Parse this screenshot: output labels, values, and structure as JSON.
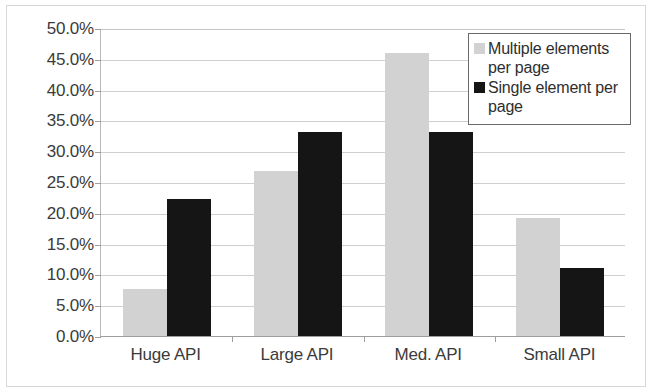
{
  "chart_data": {
    "type": "bar",
    "title": "",
    "subtitle": "",
    "xlabel": "",
    "ylabel": "",
    "categories": [
      "Huge API",
      "Large API",
      "Med. API",
      "Small API"
    ],
    "series": [
      {
        "name": "Multiple elements per page",
        "color": "#d2d2d2",
        "values": [
          7.6,
          26.8,
          46.0,
          19.2
        ]
      },
      {
        "name": "Single element per page",
        "color": "#151515",
        "values": [
          22.2,
          33.2,
          33.2,
          11.0
        ]
      }
    ],
    "ylim": [
      0,
      50
    ],
    "ytick_values": [
      0,
      5,
      10,
      15,
      20,
      25,
      30,
      35,
      40,
      45,
      50
    ],
    "ytick_labels": [
      "0.0%",
      "5.0%",
      "10.0%",
      "15.0%",
      "20.0%",
      "25.0%",
      "30.0%",
      "35.0%",
      "40.0%",
      "45.0%",
      "50.0%"
    ],
    "grid": true,
    "grid_axis": "y",
    "legend_position": "top-right",
    "legend_entries": [
      "Multiple elements per page",
      "Single element per page"
    ],
    "annotations": [],
    "colors": {
      "series_multiple": "#d2d2d2",
      "series_single": "#151515",
      "gridline": "#cfcfcf",
      "axis": "#9e9e9e",
      "text": "#3b3b3b",
      "legend_border": "#6a6a6a",
      "background": "#ffffff"
    }
  }
}
